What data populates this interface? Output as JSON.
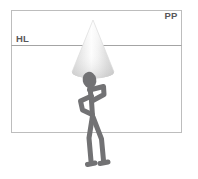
{
  "diagram": {
    "canvas": {
      "width": 198,
      "height": 179,
      "background": "#ffffff"
    },
    "picture_plane": {
      "label": "PP",
      "label_x": 171,
      "label_y": 19,
      "rect": {
        "x": 11.5,
        "y": 10.5,
        "width": 170,
        "height": 122
      },
      "stroke": "#bdbdbd",
      "stroke_width": 1,
      "fill": "#ffffff"
    },
    "horizon_line": {
      "label": "HL",
      "label_x": 16,
      "label_y": 42,
      "y": 45.5,
      "x1": 11.5,
      "x2": 181.5,
      "stroke": "#9a9a9a",
      "stroke_width": 0.9
    },
    "cone": {
      "name": "cone",
      "apex_x": 93,
      "apex_y": 20,
      "base_center_x": 93,
      "base_center_y": 72,
      "base_rx": 21,
      "base_ry": 6.5,
      "fill_light": "#ffffff",
      "fill_mid": "#e6e6e6",
      "fill_dark": "#c9c9c9",
      "outline": "#d8d8d8"
    },
    "figure": {
      "name": "stick-figure",
      "color": "#727274",
      "stroke_width": 5,
      "head": {
        "cx": 89.5,
        "cy": 80,
        "rx": 6.5,
        "ry": 8,
        "rotation": -12
      },
      "parts": [
        "head",
        "raised-arm",
        "lower-arm",
        "torso",
        "left-leg",
        "right-leg",
        "left-foot",
        "right-foot"
      ]
    },
    "colors": {
      "frame": "#bdbdbd",
      "horizon": "#9a9a9a",
      "figure": "#727274",
      "text": "#58585a",
      "cone_shade": "#d0d0d0"
    }
  }
}
